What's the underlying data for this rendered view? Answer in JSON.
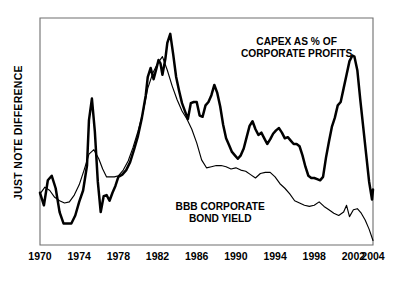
{
  "chart_data": {
    "type": "line",
    "title": "",
    "xlabel": "",
    "ylabel": "JUST  NOTE  DIFFERENCE",
    "grid": false,
    "legend_position": "inline-annotations",
    "xlim": [
      1970,
      2004
    ],
    "ylim": [
      0,
      100
    ],
    "xticks": [
      "1970",
      "1974",
      "1978",
      "1982",
      "1986",
      "1990",
      "1994",
      "1998",
      "2002",
      "2004"
    ],
    "xtick_values": [
      1970,
      1974,
      1978,
      1982,
      1986,
      1990,
      1994,
      1998,
      2002,
      2004
    ],
    "yticks": [],
    "ytick_labels": [],
    "annotations": [
      {
        "name": "capex-annotation",
        "lines": [
          "CAPEX AS % OF",
          "CORPORATE PROFITS"
        ],
        "x": 1996.2,
        "y": 88.0,
        "align": "middle"
      },
      {
        "name": "bbb-annotation",
        "lines": [
          "BBB CORPORATE",
          "BOND YIELD"
        ],
        "x": 1988.4,
        "y": 15.5,
        "align": "middle"
      }
    ],
    "series": [
      {
        "name": "CAPEX AS % OF CORPORATE PROFITS",
        "style": "thick",
        "color": "#000000",
        "x": [
          1970.0,
          1970.4,
          1970.8,
          1971.2,
          1971.6,
          1972.0,
          1972.4,
          1972.8,
          1973.2,
          1973.6,
          1974.0,
          1974.4,
          1974.8,
          1975.0,
          1975.3,
          1975.6,
          1975.9,
          1976.2,
          1976.5,
          1976.8,
          1977.1,
          1977.4,
          1977.7,
          1978.0,
          1978.4,
          1978.8,
          1979.2,
          1979.6,
          1980.0,
          1980.4,
          1980.8,
          1981.0,
          1981.3,
          1981.6,
          1981.9,
          1982.1,
          1982.3,
          1982.5,
          1982.8,
          1983.0,
          1983.3,
          1983.6,
          1983.9,
          1984.2,
          1984.5,
          1984.8,
          1985.1,
          1985.4,
          1985.7,
          1986.0,
          1986.3,
          1986.6,
          1986.9,
          1987.2,
          1987.5,
          1987.8,
          1988.1,
          1988.4,
          1988.7,
          1989.0,
          1989.3,
          1989.6,
          1989.9,
          1990.2,
          1990.5,
          1990.8,
          1991.1,
          1991.4,
          1991.7,
          1992.0,
          1992.3,
          1992.6,
          1992.9,
          1993.2,
          1993.5,
          1993.8,
          1994.1,
          1994.4,
          1994.7,
          1995.0,
          1995.3,
          1995.6,
          1995.9,
          1996.2,
          1996.5,
          1996.8,
          1997.1,
          1997.4,
          1997.7,
          1998.0,
          1998.3,
          1998.6,
          1998.9,
          1999.2,
          1999.5,
          1999.8,
          2000.1,
          2000.4,
          2000.7,
          2001.0,
          2001.3,
          2001.6,
          2001.9,
          2002.1,
          2002.4,
          2002.7,
          2003.0,
          2003.3,
          2003.6,
          2003.9,
          2004.0
        ],
        "y": [
          23.0,
          17.5,
          28.5,
          30.5,
          25.0,
          14.5,
          9.5,
          9.5,
          9.5,
          13.0,
          19.0,
          24.0,
          35.0,
          55.0,
          64.5,
          50.0,
          28.0,
          14.5,
          21.5,
          22.0,
          19.5,
          23.0,
          26.0,
          30.0,
          31.0,
          33.0,
          36.5,
          42.0,
          48.0,
          56.0,
          66.0,
          74.0,
          78.0,
          73.0,
          78.0,
          81.5,
          80.0,
          75.0,
          82.0,
          89.0,
          93.0,
          84.0,
          74.0,
          68.0,
          62.5,
          59.0,
          55.5,
          62.5,
          63.0,
          63.0,
          57.0,
          56.5,
          61.5,
          63.0,
          66.0,
          70.5,
          67.0,
          61.0,
          53.0,
          47.0,
          44.0,
          41.0,
          39.5,
          38.0,
          39.5,
          42.5,
          47.5,
          52.5,
          54.5,
          51.0,
          48.5,
          49.5,
          47.0,
          44.5,
          46.5,
          49.0,
          50.5,
          51.5,
          49.5,
          47.0,
          47.5,
          46.0,
          44.5,
          44.5,
          43.5,
          39.5,
          34.5,
          30.5,
          29.5,
          29.5,
          29.0,
          28.5,
          30.0,
          38.5,
          45.5,
          52.0,
          56.0,
          61.5,
          63.0,
          69.0,
          75.0,
          81.0,
          83.5,
          83.0,
          77.0,
          64.0,
          52.0,
          40.0,
          28.0,
          20.0,
          24.5
        ]
      },
      {
        "name": "BBB CORPORATE BOND YIELD",
        "style": "thin",
        "color": "#000000",
        "x": [
          1970.0,
          1970.5,
          1971.0,
          1971.5,
          1972.0,
          1972.5,
          1973.0,
          1973.5,
          1974.0,
          1974.5,
          1975.0,
          1975.5,
          1976.0,
          1976.4,
          1976.8,
          1977.2,
          1977.6,
          1978.0,
          1978.5,
          1979.0,
          1979.5,
          1980.0,
          1980.5,
          1981.0,
          1981.5,
          1982.0,
          1982.5,
          1983.0,
          1983.5,
          1984.0,
          1984.5,
          1985.0,
          1985.5,
          1986.0,
          1986.5,
          1987.0,
          1987.5,
          1988.0,
          1988.5,
          1989.0,
          1989.5,
          1990.0,
          1990.5,
          1991.0,
          1991.5,
          1992.0,
          1992.5,
          1993.0,
          1993.5,
          1994.0,
          1994.5,
          1995.0,
          1995.5,
          1996.0,
          1996.5,
          1997.0,
          1997.5,
          1998.0,
          1998.5,
          1999.0,
          1999.5,
          2000.0,
          2000.5,
          2001.0,
          2001.3,
          2001.6,
          2002.0,
          2002.4,
          2002.8,
          2003.2,
          2003.6,
          2004.0
        ],
        "y": [
          22.5,
          25.5,
          24.0,
          21.0,
          19.5,
          18.5,
          19.0,
          22.0,
          26.5,
          33.0,
          40.0,
          42.0,
          38.0,
          33.5,
          30.0,
          30.0,
          30.0,
          30.5,
          33.0,
          37.0,
          43.0,
          50.0,
          58.0,
          69.0,
          75.5,
          80.0,
          83.0,
          77.0,
          70.0,
          64.0,
          59.0,
          55.5,
          51.0,
          45.0,
          37.5,
          34.0,
          34.5,
          35.0,
          35.0,
          34.5,
          33.5,
          34.0,
          33.0,
          32.5,
          31.0,
          29.5,
          31.5,
          32.0,
          32.0,
          30.0,
          27.0,
          25.0,
          22.5,
          19.5,
          18.5,
          17.5,
          17.0,
          17.5,
          19.0,
          17.0,
          15.5,
          14.0,
          13.0,
          14.5,
          17.5,
          12.5,
          15.5,
          16.0,
          14.0,
          11.0,
          7.0,
          2.0
        ]
      }
    ]
  },
  "plot_frame": {
    "left_px": 40,
    "right_px": 373,
    "top_px": 18,
    "bottom_px": 245,
    "border_color": "#6e6e6e"
  }
}
